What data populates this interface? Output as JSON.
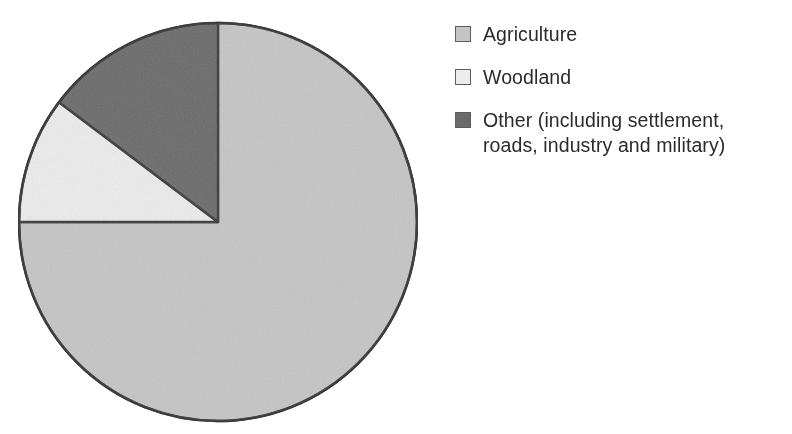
{
  "chart_data": {
    "type": "pie",
    "title": "",
    "subtitle": "",
    "xlabel": "",
    "ylabel": "",
    "grid": false,
    "legend_position": "right",
    "start_angle_deg": 0,
    "direction": "clockwise",
    "categories": [
      "Agriculture",
      "Woodland",
      "Other (including settlement, roads, industry and military)"
    ],
    "values": [
      75,
      10,
      15
    ],
    "value_unit": "percent",
    "slices": [
      {
        "label": "Agriculture",
        "value": 75,
        "start_angle_deg": 0,
        "end_angle_deg": 270,
        "sweep_deg": 270,
        "color": "#c5c5c5"
      },
      {
        "label": "Woodland",
        "value": 10,
        "start_angle_deg": 270,
        "end_angle_deg": 307,
        "sweep_deg": 37,
        "color": "#ececec"
      },
      {
        "label": "Other (including settlement, roads, industry and military)",
        "value": 15,
        "start_angle_deg": 307,
        "end_angle_deg": 360,
        "sweep_deg": 53,
        "color": "#6b6b6b"
      }
    ],
    "outline_color": "#3a3a3a"
  },
  "legend": {
    "items": [
      {
        "label": "Agriculture",
        "color": "#c5c5c5",
        "swatch_name": "legend-swatch-agriculture"
      },
      {
        "label": "Woodland",
        "color": "#ececec",
        "swatch_name": "legend-swatch-woodland"
      },
      {
        "label": "Other (including settlement,\nroads, industry and military)",
        "color": "#6b6b6b",
        "swatch_name": "legend-swatch-other"
      }
    ]
  },
  "colors": {
    "background": "#ffffff",
    "text": "#2b2b2b",
    "outline": "#3a3a3a",
    "agriculture": "#c5c5c5",
    "woodland": "#ececec",
    "other": "#6b6b6b"
  }
}
